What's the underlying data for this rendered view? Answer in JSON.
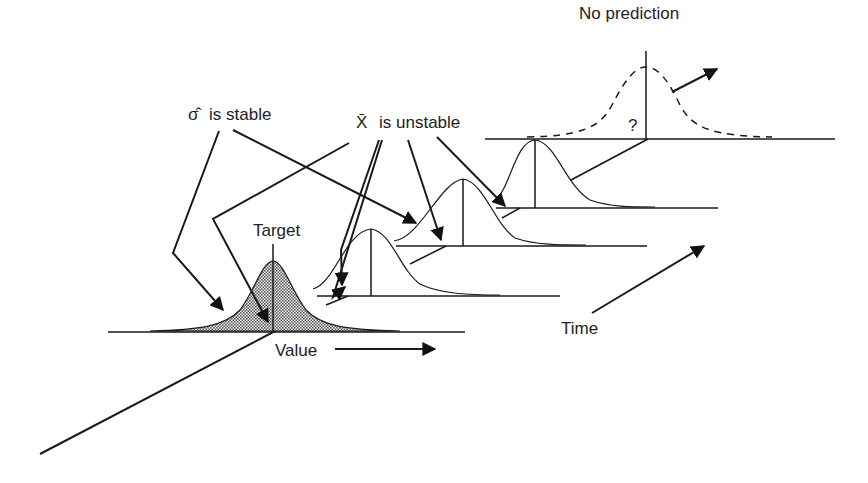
{
  "diagram": {
    "labels": {
      "no_prediction": "No prediction",
      "sigma_hat": "σ̂",
      "sigma_stable_text": "is stable",
      "xbar": "X̄",
      "xbar_unstable_text": "is unstable",
      "target": "Target",
      "value": "Value",
      "time": "Time",
      "question": "?"
    },
    "colors": {
      "ink": "#1a1a1a",
      "fill_shaded": "#8a8a8a",
      "background": "#ffffff"
    }
  }
}
